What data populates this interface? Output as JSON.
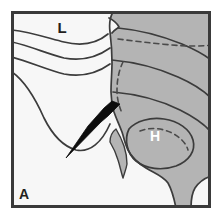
{
  "figure": {
    "panel_label": "A",
    "annotations": [
      {
        "name": "lung-label",
        "text": "L",
        "x": 62,
        "y": 33,
        "color": "#231f20",
        "size": 15
      },
      {
        "name": "liver-label",
        "text": "H",
        "x": 155,
        "y": 141,
        "color": "#ffffff",
        "size": 14
      },
      {
        "name": "panel-label",
        "text": "A",
        "x": 24,
        "y": 199,
        "color": "#231f20",
        "size": 14
      }
    ],
    "colors": {
      "frame": "#3a3a3a",
      "background": "#f7f7f7",
      "tissue_fill": "#b4b4b4",
      "outline": "#3c3c3c",
      "dashed": "#4a4a4a",
      "pointer": "#0d0d0d",
      "label_light": "#ffffff",
      "label_dark": "#231f20"
    },
    "frame": {
      "x": 11,
      "y": 11,
      "width": 200,
      "height": 197,
      "stroke_width": 3
    },
    "pointer": {
      "name": "arrow-pointer",
      "tip_x": 118,
      "tip_y": 106,
      "tail_x": 66,
      "tail_y": 158,
      "description": "solid black arrow pointing up-right toward tissue interface"
    },
    "elements": [
      {
        "name": "tissue-region",
        "type": "filled-shape",
        "fill": "#b4b4b4"
      },
      {
        "name": "pleural-line-1",
        "type": "curve"
      },
      {
        "name": "pleural-line-2",
        "type": "curve"
      },
      {
        "name": "pleural-line-3",
        "type": "curve"
      },
      {
        "name": "diaphragm-curve",
        "type": "curve"
      },
      {
        "name": "dashed-line-upper",
        "type": "dashed-curve"
      },
      {
        "name": "dashed-line-lateral",
        "type": "dashed-curve"
      },
      {
        "name": "dashed-line-lesion",
        "type": "dashed-curve"
      },
      {
        "name": "lesion-outline",
        "type": "closed-curve"
      },
      {
        "name": "rib-sliver",
        "type": "filled-shape"
      },
      {
        "name": "apex-notch",
        "type": "filled-shape"
      }
    ]
  }
}
